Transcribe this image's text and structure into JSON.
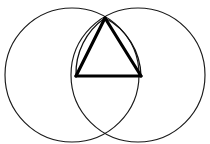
{
  "figure": {
    "type": "geometric-construction",
    "canvas": {
      "width": 210,
      "height": 144,
      "background": "#ffffff"
    },
    "colors": {
      "circle_stroke": "#1a1a1a",
      "arc_stroke": "#111111",
      "triangle_stroke": "#000000",
      "background": "#ffffff"
    },
    "circles": [
      {
        "name": "left-circle",
        "cx": 72,
        "cy": 75,
        "r": 67,
        "stroke_width": 1.15
      },
      {
        "name": "right-circle",
        "cx": 138,
        "cy": 75,
        "r": 67,
        "stroke_width": 1.15
      }
    ],
    "intersection_points": [
      {
        "name": "top-intersection",
        "x": 105,
        "y": 18
      },
      {
        "name": "bottom-intersection",
        "x": 105,
        "y": 132
      }
    ],
    "triangle": {
      "name": "inscribed-triangle",
      "stroke_width": 3.1,
      "vertices": [
        {
          "name": "apex",
          "x": 105,
          "y": 18
        },
        {
          "name": "base-left",
          "x": 76,
          "y": 76
        },
        {
          "name": "base-right",
          "x": 141,
          "y": 76
        }
      ],
      "edges": [
        {
          "name": "left-side",
          "from": "apex",
          "to": "base-left"
        },
        {
          "name": "right-side",
          "from": "apex",
          "to": "base-right"
        },
        {
          "name": "base",
          "from": "base-left",
          "to": "base-right"
        }
      ]
    },
    "arcs": [
      {
        "name": "left-bulge-arc",
        "from": {
          "x": 105,
          "y": 18
        },
        "to": {
          "x": 76,
          "y": 76
        },
        "radius": 67,
        "sweep": "outward-left",
        "belongs_to": "right-circle"
      },
      {
        "name": "right-bulge-arc",
        "from": {
          "x": 105,
          "y": 18
        },
        "to": {
          "x": 141,
          "y": 76
        },
        "radius": 67,
        "sweep": "outward-right",
        "belongs_to": "left-circle"
      }
    ]
  }
}
